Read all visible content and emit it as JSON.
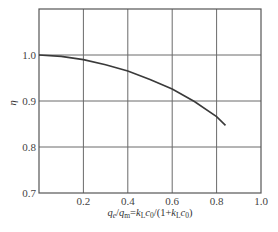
{
  "chart_data": {
    "type": "line",
    "title": "",
    "xlabel": "q_e/q_m=k_L c_0/(1+k_L c_0)",
    "ylabel": "η",
    "xlim": [
      0,
      1.0
    ],
    "ylim": [
      0.7,
      1.1
    ],
    "grid": true,
    "x_ticks": [
      0.2,
      0.4,
      0.6,
      0.8,
      1.0
    ],
    "y_ticks": [
      0.7,
      0.8,
      0.9,
      1.0
    ],
    "x_tick_labels": [
      "0.2",
      "0.4",
      "0.6",
      "0.8",
      "1.0"
    ],
    "y_tick_labels": [
      "0.7",
      "0.8",
      "0.9",
      "1.0"
    ],
    "legend": [],
    "series": [
      {
        "name": "η",
        "x": [
          0.0,
          0.1,
          0.2,
          0.3,
          0.4,
          0.5,
          0.6,
          0.7,
          0.8,
          0.84
        ],
        "y": [
          1.0,
          0.997,
          0.99,
          0.979,
          0.965,
          0.947,
          0.926,
          0.899,
          0.866,
          0.847
        ]
      }
    ]
  },
  "labels": {
    "xlabel_parts": {
      "q1": "q",
      "q1_sub": "e",
      "slash1": "/",
      "q2": "q",
      "q2_sub": "m",
      "eq": "=",
      "k1": "k",
      "k1_sub": "L",
      "c1": "c",
      "c1_sub": "0",
      "mid": "/(1+",
      "k2": "k",
      "k2_sub": "L",
      "c2": "c",
      "c2_sub": "0",
      "end": ")"
    }
  }
}
